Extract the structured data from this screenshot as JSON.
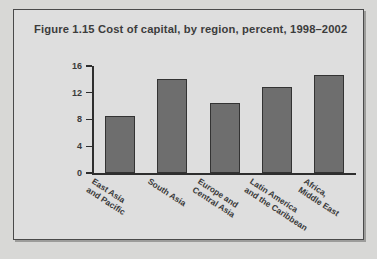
{
  "figure": {
    "title": "Figure 1.15  Cost of capital, by region, percent, 1998–2002",
    "frame_color": "#4a4a4a",
    "background_color": "#dedede",
    "page_background_color": "#d8d8d6"
  },
  "source_note": "",
  "chart_data": {
    "type": "bar",
    "title": "Figure 1.15  Cost of capital, by region, percent, 1998–2002",
    "categories": [
      "East Asia and Pacific",
      "South Asia",
      "Europe and Central Asia",
      "Latin America and the Caribbean",
      "Africa, Middle East"
    ],
    "category_lines": [
      [
        "East Asia",
        "and Pacific"
      ],
      [
        "South Asia",
        ""
      ],
      [
        "Europe and",
        "Central Asia"
      ],
      [
        "Latin America",
        "and the Caribbean"
      ],
      [
        "Africa,",
        "Middle East"
      ]
    ],
    "values": [
      8.6,
      14.1,
      10.5,
      12.9,
      14.6
    ],
    "xlabel": "",
    "ylabel": "",
    "ylim": [
      0,
      16
    ],
    "yticks": [
      0,
      4,
      8,
      12,
      16
    ],
    "ytick_labels": [
      "0",
      "4",
      "8",
      "12",
      "16"
    ],
    "grid": false,
    "legend": false,
    "bar_color": "#6e6e6e",
    "bar_edge_color": "#333333",
    "axis_color": "#2e2e2e"
  }
}
